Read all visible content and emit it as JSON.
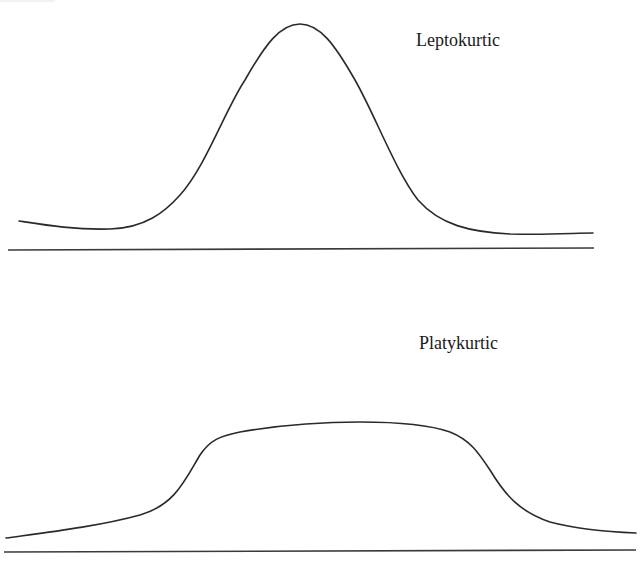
{
  "diagram": {
    "panels": [
      {
        "id": "leptokurtic",
        "label": "Leptokurtic",
        "shape": "tall narrow peak with thin tails",
        "curve_path": "M19,221 C45,225 75,230 110,229 C145,228 165,212 180,195 C205,168 225,110 245,80 C265,45 280,24 300,24 C320,24 335,45 355,80 C375,115 395,170 418,200 C440,225 470,232 510,234 C550,235 575,233 593,233",
        "baseline_path": "M8,250 L594,248"
      },
      {
        "id": "platykurtic",
        "label": "Platykurtic",
        "shape": "broad flat-topped plateau",
        "curve_path": "M6,538 C50,532 100,526 140,515 C175,505 185,480 200,455 C210,440 220,436 240,432 C280,425 320,422 360,422 C400,422 430,425 450,432 C470,440 478,452 490,470 C505,495 520,512 550,522 C580,530 610,532 636,533",
        "baseline_path": "M4,552 L636,550"
      }
    ]
  },
  "chart_data": {
    "type": "line",
    "title": "",
    "series": [
      {
        "name": "Leptokurtic",
        "description": "High, sharply peaked distribution with thin tails",
        "points_px": [
          [
            19,
            221
          ],
          [
            100,
            229
          ],
          [
            140,
            222
          ],
          [
            195,
            180
          ],
          [
            243,
            100
          ],
          [
            300,
            24
          ],
          [
            358,
            100
          ],
          [
            410,
            180
          ],
          [
            460,
            225
          ],
          [
            520,
            234
          ],
          [
            593,
            233
          ]
        ]
      },
      {
        "name": "Platykurtic",
        "description": "Low, broad flat-topped distribution",
        "points_px": [
          [
            6,
            538
          ],
          [
            140,
            515
          ],
          [
            200,
            455
          ],
          [
            240,
            432
          ],
          [
            360,
            422
          ],
          [
            450,
            432
          ],
          [
            490,
            470
          ],
          [
            550,
            522
          ],
          [
            636,
            533
          ]
        ]
      }
    ],
    "xlabel": "",
    "ylabel": "",
    "grid": false,
    "legend": "inline labels top-right of each panel"
  }
}
